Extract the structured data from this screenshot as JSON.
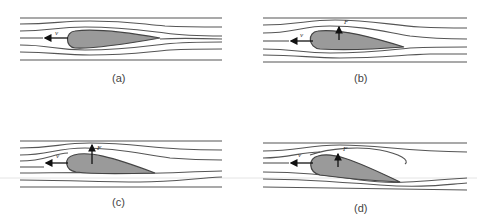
{
  "figure": {
    "colors": {
      "streamline": "#555555",
      "airfoil_fill": "#9a9a9a",
      "airfoil_outline": "#444444",
      "vector": "#111111",
      "caption": "#444444"
    },
    "panels": [
      {
        "id": "a",
        "caption": "(a)",
        "velocity_label": "v",
        "force_label": "",
        "angle_of_attack": "zero",
        "has_lift_arrow": false,
        "flow_separation": false
      },
      {
        "id": "b",
        "caption": "(b)",
        "velocity_label": "v",
        "force_label": "F",
        "angle_of_attack": "small",
        "has_lift_arrow": true,
        "flow_separation": false
      },
      {
        "id": "c",
        "caption": "(c)",
        "velocity_label": "v",
        "force_label": "F",
        "angle_of_attack": "moderate",
        "has_lift_arrow": true,
        "flow_separation": false
      },
      {
        "id": "d",
        "caption": "(d)",
        "velocity_label": "v",
        "force_label": "F",
        "angle_of_attack": "large",
        "has_lift_arrow": true,
        "flow_separation": true
      }
    ]
  }
}
